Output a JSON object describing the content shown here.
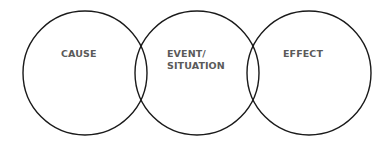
{
  "diagram": {
    "type": "three-circle overlapping chain",
    "stroke_color": "#1a1a1a",
    "label_color": "#5a5a5a",
    "circles": [
      {
        "id": "cause",
        "label": "CAUSE"
      },
      {
        "id": "event",
        "label_line1": "EVENT/",
        "label_line2": "SITUATION"
      },
      {
        "id": "effect",
        "label": "EFFECT"
      }
    ]
  }
}
